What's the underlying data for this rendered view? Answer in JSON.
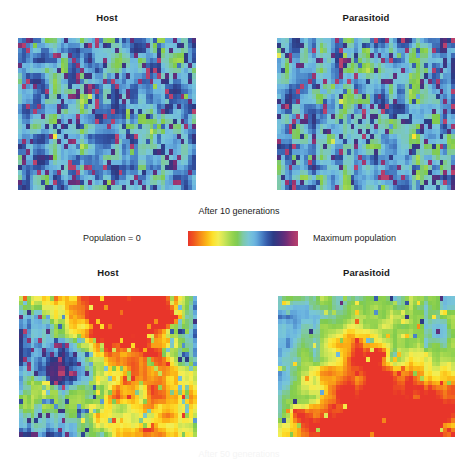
{
  "figure": {
    "background_color": "#ffffff",
    "width": 473,
    "height": 459
  },
  "panels": [
    {
      "id": "host-10",
      "title": "Host",
      "stage": "After 10 generations"
    },
    {
      "id": "parasitoid-10",
      "title": "Parasitoid",
      "stage": "After 10 generations"
    },
    {
      "id": "host-50",
      "title": "Host",
      "stage": "After 50 generations"
    },
    {
      "id": "parasitoid-50",
      "title": "Parasitoid",
      "stage": "After 50 generations"
    }
  ],
  "captions": {
    "generations_10": "After 10 generations",
    "generations_50": "After 50 generations"
  },
  "legend": {
    "min_label": "Population = 0",
    "max_label": "Maximum population",
    "colorbar_stops": [
      "#e8352a",
      "#f05a1e",
      "#f6891a",
      "#fbb415",
      "#fde02b",
      "#f2ee55",
      "#c9e457",
      "#9ed64f",
      "#7fcb4e",
      "#7ec9a8",
      "#78c6d8",
      "#6ab3e0",
      "#4b86c8",
      "#3458a8",
      "#2c3b84",
      "#47317e",
      "#6b2d79",
      "#9a3470",
      "#b8416d"
    ]
  },
  "chart_data": {
    "type": "heatmap",
    "title": "",
    "xlabel": "",
    "ylabel": "",
    "grid": false,
    "legend_position": "center-middle",
    "colormap": "jet-reversed (red = 0 population, purple = maximum population)",
    "colormap_domain": [
      0,
      1
    ],
    "panel_grid_shape": {
      "columns": 46,
      "rows": 30
    },
    "panels": [
      {
        "name": "Host — after 10 generations",
        "row": 0,
        "column": 0,
        "value_summary": {
          "dominant_band": "green-to-cyan (mid population)",
          "mean_value": 0.55,
          "min_value": 0.3,
          "max_value": 0.95,
          "fraction_high_density": 0.18,
          "fraction_mid_density": 0.7,
          "fraction_low_density": 0.12
        }
      },
      {
        "name": "Parasitoid — after 10 generations",
        "row": 0,
        "column": 1,
        "value_summary": {
          "dominant_band": "green-to-cyan (mid population)",
          "mean_value": 0.54,
          "min_value": 0.28,
          "max_value": 0.96,
          "fraction_high_density": 0.16,
          "fraction_mid_density": 0.72,
          "fraction_low_density": 0.12
        }
      },
      {
        "name": "Host — after 50 generations",
        "row": 1,
        "column": 0,
        "value_summary": {
          "dominant_band": "mixed: green/cyan core with red-orange spiral arms",
          "mean_value": 0.5,
          "min_value": 0.02,
          "max_value": 0.95,
          "fraction_high_density": 0.22,
          "fraction_mid_density": 0.48,
          "fraction_low_density": 0.3
        }
      },
      {
        "name": "Parasitoid — after 50 generations",
        "row": 1,
        "column": 1,
        "value_summary": {
          "dominant_band": "red-orange-yellow (low population / spiral wave)",
          "mean_value": 0.22,
          "min_value": 0.01,
          "max_value": 0.88,
          "fraction_high_density": 0.04,
          "fraction_mid_density": 0.26,
          "fraction_low_density": 0.7
        }
      }
    ]
  }
}
